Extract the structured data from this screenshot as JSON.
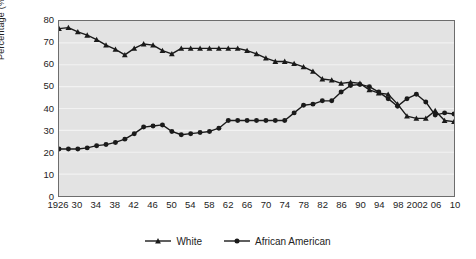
{
  "chart_data": {
    "type": "line",
    "title": "",
    "xlabel": "",
    "ylabel": "Percentage (%)",
    "ylim": [
      0,
      80
    ],
    "ytick_step": 10,
    "yticks": [
      0,
      10,
      20,
      30,
      40,
      50,
      60,
      70,
      80
    ],
    "ytick_labels": [
      "0",
      "10",
      "20",
      "30",
      "40",
      "50",
      "60",
      "70",
      "80"
    ],
    "xlim": [
      1926,
      2010
    ],
    "xticks": [
      1926,
      1930,
      1934,
      1938,
      1942,
      1946,
      1950,
      1954,
      1958,
      1962,
      1966,
      1970,
      1974,
      1978,
      1982,
      1986,
      1990,
      1994,
      1998,
      2002,
      2006,
      2010
    ],
    "xtick_labels": [
      "1926",
      "30",
      "34",
      "38",
      "42",
      "46",
      "50",
      "54",
      "58",
      "62",
      "66",
      "70",
      "74",
      "78",
      "82",
      "86",
      "90",
      "94",
      "98",
      "2002",
      "06",
      "10"
    ],
    "grid": true,
    "grid_axis": "y",
    "legend_position": "bottom-center",
    "plot_background": "#e3e3e3",
    "line_color": "#1a1a1a",
    "x": [
      1926,
      1928,
      1930,
      1932,
      1934,
      1936,
      1938,
      1940,
      1942,
      1944,
      1946,
      1948,
      1950,
      1952,
      1954,
      1956,
      1958,
      1960,
      1962,
      1964,
      1966,
      1968,
      1970,
      1972,
      1974,
      1976,
      1978,
      1980,
      1982,
      1984,
      1986,
      1988,
      1990,
      1992,
      1994,
      1996,
      1998,
      2000,
      2002,
      2004,
      2006,
      2008,
      2010
    ],
    "series": [
      {
        "name": "White",
        "marker": "triangle",
        "values": [
          76.5,
          77.0,
          75.0,
          73.5,
          71.5,
          69.0,
          67.0,
          64.5,
          67.5,
          69.5,
          69.0,
          66.5,
          65.0,
          67.5,
          67.5,
          67.5,
          67.5,
          67.5,
          67.5,
          67.5,
          66.5,
          65.0,
          63.0,
          61.5,
          61.5,
          60.5,
          59.0,
          57.0,
          53.5,
          53.0,
          51.5,
          52.0,
          51.5,
          48.5,
          47.0,
          46.5,
          42.0,
          36.5,
          35.5,
          35.5,
          39.0,
          34.5,
          34.0
        ]
      },
      {
        "name": "African American",
        "marker": "circle",
        "values": [
          21.5,
          21.5,
          21.5,
          22.0,
          23.0,
          23.5,
          24.5,
          26.0,
          28.5,
          31.5,
          32.0,
          32.5,
          29.5,
          28.0,
          28.5,
          29.0,
          29.5,
          31.0,
          34.5,
          34.5,
          34.5,
          34.5,
          34.5,
          34.5,
          34.5,
          38.0,
          41.5,
          42.0,
          43.5,
          43.5,
          47.5,
          50.5,
          51.0,
          50.0,
          47.5,
          44.5,
          41.0,
          44.5,
          46.5,
          43.0,
          37.0,
          38.0,
          37.5
        ]
      }
    ]
  }
}
